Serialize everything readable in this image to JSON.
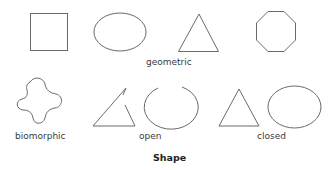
{
  "diagram": {
    "title": "Shape",
    "groups": {
      "geometric": "geometric",
      "biomorphic": "biomorphic",
      "open": "open",
      "closed": "closed"
    },
    "shapes": [
      {
        "name": "square",
        "group": "geometric"
      },
      {
        "name": "ellipse",
        "group": "geometric"
      },
      {
        "name": "triangle",
        "group": "geometric"
      },
      {
        "name": "octagon",
        "group": "geometric"
      },
      {
        "name": "blob",
        "group": "biomorphic"
      },
      {
        "name": "open-triangle",
        "group": "open"
      },
      {
        "name": "open-circle",
        "group": "open"
      },
      {
        "name": "triangle",
        "group": "closed"
      },
      {
        "name": "ellipse",
        "group": "closed"
      }
    ],
    "stroke_color": "#6a6a6a"
  }
}
